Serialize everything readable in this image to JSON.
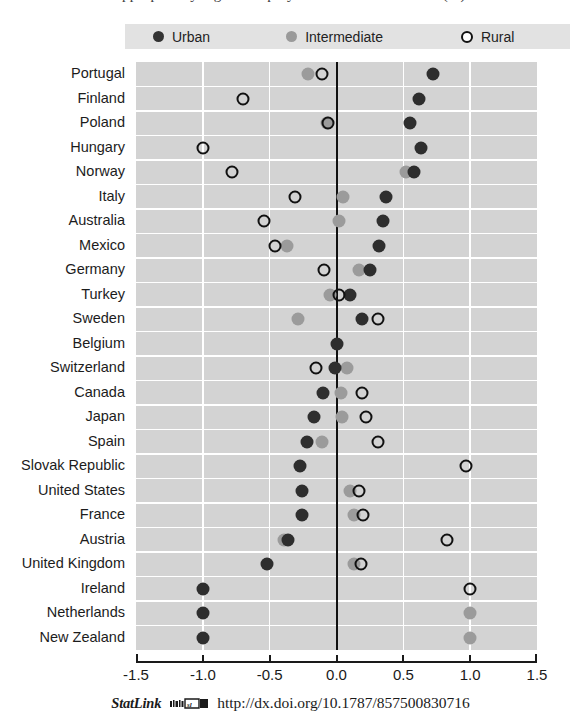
{
  "title_remnant": "appropriately high unemployment rate of rural areas (%)",
  "legend": {
    "items": [
      {
        "key": "urban",
        "label": "Urban",
        "marker": "filled-dark-circle",
        "color": "#333333"
      },
      {
        "key": "intermediate",
        "label": "Intermediate",
        "marker": "filled-grey-circle",
        "color": "#9a9a9a"
      },
      {
        "key": "rural",
        "label": "Rural",
        "marker": "open-circle",
        "color": "#111111"
      }
    ]
  },
  "footer": {
    "statlink_label": "StatLink",
    "icon": "statlink-barcode-icon",
    "url": "http://dx.doi.org/10.1787/857500830716"
  },
  "chart_data": {
    "type": "scatter",
    "orientation": "horizontal-dot-plot",
    "title": "",
    "xlabel": "",
    "ylabel": "",
    "xlim": [
      -1.5,
      1.5
    ],
    "xticks": [
      -1.5,
      -1.0,
      -0.5,
      0.0,
      0.5,
      1.0,
      1.5
    ],
    "xticklabels": [
      "-1.5",
      "-1.0",
      "-0.5",
      "0.0",
      "0.5",
      "1.0",
      "1.5"
    ],
    "grid": true,
    "legend_position": "top",
    "zero_reference_line": 0.0,
    "categories": [
      "Portugal",
      "Finland",
      "Poland",
      "Hungary",
      "Norway",
      "Italy",
      "Australia",
      "Mexico",
      "Germany",
      "Turkey",
      "Sweden",
      "Belgium",
      "Switzerland",
      "Canada",
      "Japan",
      "Spain",
      "Slovak Republic",
      "United States",
      "France",
      "Austria",
      "United Kingdom",
      "Ireland",
      "Netherlands",
      "New Zealand"
    ],
    "series": [
      {
        "name": "Urban",
        "color": "#2e2e2e",
        "marker": "filled-circle",
        "values": [
          0.72,
          0.62,
          0.55,
          0.63,
          0.58,
          0.37,
          0.35,
          0.32,
          0.25,
          0.1,
          0.19,
          0.0,
          -0.01,
          -0.1,
          -0.17,
          -0.22,
          -0.27,
          -0.26,
          -0.26,
          -0.36,
          -0.52,
          -1.0,
          -1.0,
          -1.0
        ]
      },
      {
        "name": "Intermediate",
        "color": "#9b9b9b",
        "marker": "filled-circle",
        "values": [
          -0.21,
          null,
          -0.07,
          null,
          0.52,
          0.05,
          0.02,
          -0.37,
          0.17,
          -0.05,
          -0.29,
          null,
          0.08,
          0.03,
          0.04,
          -0.11,
          null,
          0.1,
          0.13,
          -0.39,
          0.13,
          null,
          1.0,
          1.0
        ]
      },
      {
        "name": "Rural",
        "color": "#111111",
        "marker": "open-circle",
        "values": [
          -0.11,
          -0.7,
          -0.06,
          -1.0,
          -0.78,
          -0.31,
          -0.54,
          -0.46,
          -0.09,
          0.02,
          0.31,
          null,
          -0.15,
          0.19,
          0.22,
          0.31,
          0.97,
          0.17,
          0.2,
          0.83,
          0.18,
          1.0,
          null,
          null
        ]
      }
    ]
  }
}
